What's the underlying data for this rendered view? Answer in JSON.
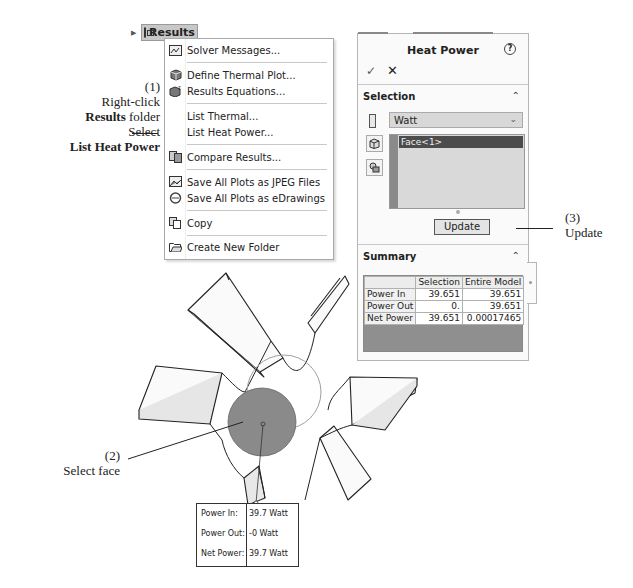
{
  "callouts": {
    "step1": {
      "number": "(1)",
      "line1": "Right-click",
      "line2_bold": "Results",
      "line2_rest": " folder",
      "line3": "Select",
      "line4_bold": "List Heat Power"
    },
    "step2": {
      "number": "(2)",
      "text": "Select face"
    },
    "step3": {
      "number": "(3)",
      "text": "Update"
    }
  },
  "tree": {
    "node_label": "Results",
    "icon": "folder-icon"
  },
  "context_menu": {
    "items": [
      {
        "label": "Solver Messages...",
        "icon": "solver-messages-icon"
      },
      {
        "label": "Define Thermal Plot...",
        "icon": "thermal-plot-icon"
      },
      {
        "label": "Results Equations...",
        "icon": "results-equations-icon"
      },
      {
        "label": "List Thermal...",
        "icon": ""
      },
      {
        "label": "List Heat Power...",
        "icon": ""
      },
      {
        "label": "Compare Results...",
        "icon": "compare-results-icon"
      },
      {
        "label": "Save All Plots as JPEG Files",
        "icon": "save-jpeg-icon"
      },
      {
        "label": "Save All Plots as eDrawings",
        "icon": "edrawings-icon"
      },
      {
        "label": "Copy",
        "icon": "copy-icon"
      },
      {
        "label": "Create New Folder",
        "icon": "new-folder-icon"
      }
    ]
  },
  "panel": {
    "title": "Heat Power",
    "help_glyph": "?",
    "ok_glyph": "✓",
    "cancel_glyph": "✕",
    "selection": {
      "header": "Selection",
      "units": "Watt",
      "selected_entities": [
        "Face<1>"
      ],
      "update_label": "Update"
    },
    "summary": {
      "header": "Summary",
      "columns": [
        "",
        "Selection",
        "Entire Model"
      ],
      "rows": [
        {
          "label": "Power In",
          "selection": "39.651",
          "entire_model": "39.651"
        },
        {
          "label": "Power Out",
          "selection": "0.",
          "entire_model": "39.651"
        },
        {
          "label": "Net Power",
          "selection": "39.651",
          "entire_model": "0.00017465"
        }
      ]
    }
  },
  "result_tooltip": {
    "rows": [
      {
        "label": "Power In:",
        "value": "39.7 Watt"
      },
      {
        "label": "Power Out:",
        "value": "-0 Watt"
      },
      {
        "label": "Net Power:",
        "value": "39.7 Watt"
      }
    ]
  },
  "colors": {
    "selected_face": "#8a8a8a",
    "panel_bg": "#fafafa",
    "selection_highlight": "#4c4c4c"
  }
}
